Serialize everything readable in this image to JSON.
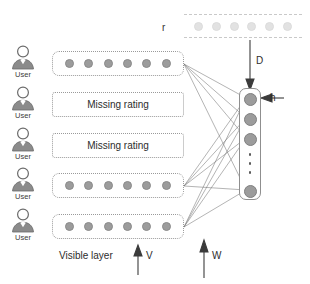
{
  "diagram": {
    "colors": {
      "node_fill": "#9c9c9c",
      "faded_node_fill": "#e2e2e2",
      "box_border": "#9a9a9a",
      "hidden_border": "#8f8f8f",
      "line": "#6f6f6f",
      "text": "#2d2d2d"
    },
    "reconstruction_layer": {
      "label": "r",
      "node_count": 6,
      "style": "dashed-faded"
    },
    "users": [
      {
        "icon": "user-icon",
        "label": "User",
        "row_type": "ratings",
        "node_count": 6
      },
      {
        "icon": "user-icon",
        "label": "User",
        "row_type": "missing",
        "text": "Missing rating"
      },
      {
        "icon": "user-icon",
        "label": "User",
        "row_type": "missing",
        "text": "Missing rating"
      },
      {
        "icon": "user-icon",
        "label": "User",
        "row_type": "ratings",
        "node_count": 6
      },
      {
        "icon": "user-icon",
        "label": "User",
        "row_type": "ratings",
        "node_count": 6
      }
    ],
    "hidden_layer": {
      "visible_node_count": 4,
      "ellipsis_dots": 3,
      "label": "h",
      "arrow": "arrow-left"
    },
    "annotations": {
      "visible_layer": "Visible layer",
      "weight_v": "V",
      "weight_w": "W",
      "weight_d": "D",
      "hidden_h": "h",
      "reconstruction_r": "r"
    }
  }
}
